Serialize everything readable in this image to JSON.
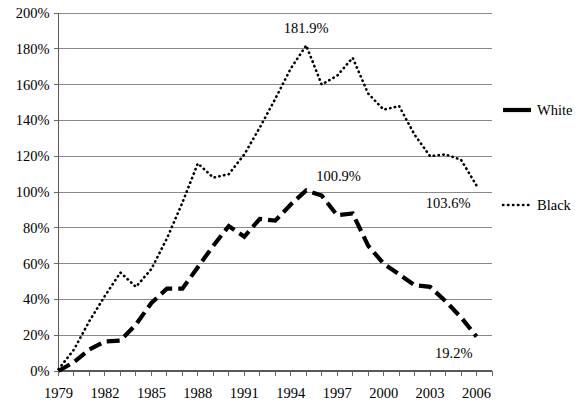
{
  "chart_data": {
    "type": "line",
    "title": "",
    "xlabel": "",
    "ylabel": "",
    "xlim": [
      1979,
      2007
    ],
    "ylim": [
      0,
      200
    ],
    "grid": true,
    "legend_position": "right",
    "y_tick_labels": [
      "0%",
      "20%",
      "40%",
      "60%",
      "80%",
      "100%",
      "120%",
      "140%",
      "160%",
      "180%",
      "200%"
    ],
    "y_tick_values": [
      0,
      20,
      40,
      60,
      80,
      100,
      120,
      140,
      160,
      180,
      200
    ],
    "x_tick_labels": [
      "1979",
      "1982",
      "1985",
      "1988",
      "1991",
      "1994",
      "1997",
      "2000",
      "2003",
      "2006"
    ],
    "x_tick_values": [
      1979,
      1982,
      1985,
      1988,
      1991,
      1994,
      1997,
      2000,
      2003,
      2006
    ],
    "x": [
      1979,
      1980,
      1981,
      1982,
      1983,
      1984,
      1985,
      1986,
      1987,
      1988,
      1989,
      1990,
      1991,
      1992,
      1993,
      1994,
      1995,
      1996,
      1997,
      1998,
      1999,
      2000,
      2001,
      2002,
      2003,
      2004,
      2005,
      2006
    ],
    "series": [
      {
        "name": "White",
        "style": "dashed-thick",
        "color": "#000000",
        "values": [
          0.0,
          5.0,
          12.0,
          16.5,
          17.0,
          26.0,
          38.0,
          46.0,
          46.0,
          58.0,
          70.0,
          81.0,
          75.0,
          85.0,
          84.0,
          93.0,
          100.9,
          98.0,
          87.0,
          88.0,
          70.0,
          60.0,
          54.0,
          48.0,
          47.0,
          39.0,
          30.0,
          19.2
        ]
      },
      {
        "name": "Black",
        "style": "dotted",
        "color": "#000000",
        "values": [
          1.0,
          12.0,
          28.0,
          42.0,
          55.0,
          47.0,
          57.0,
          74.0,
          94.0,
          116.0,
          108.0,
          110.0,
          121.0,
          136.0,
          152.0,
          169.0,
          181.9,
          160.0,
          165.0,
          175.0,
          155.0,
          146.0,
          148.0,
          132.0,
          120.0,
          121.0,
          118.0,
          103.6
        ]
      }
    ],
    "annotations": [
      {
        "text": "181.9%",
        "series": "Black",
        "x": 1995,
        "y": 181.9
      },
      {
        "text": "100.9%",
        "series": "White",
        "x": 1995,
        "y": 100.9
      },
      {
        "text": "103.6%",
        "series": "Black",
        "x": 2006,
        "y": 103.6
      },
      {
        "text": "19.2%",
        "series": "White",
        "x": 2006,
        "y": 19.2
      }
    ],
    "legend": [
      {
        "label": "White",
        "style": "dashed-thick"
      },
      {
        "label": "Black",
        "style": "dotted"
      }
    ]
  }
}
